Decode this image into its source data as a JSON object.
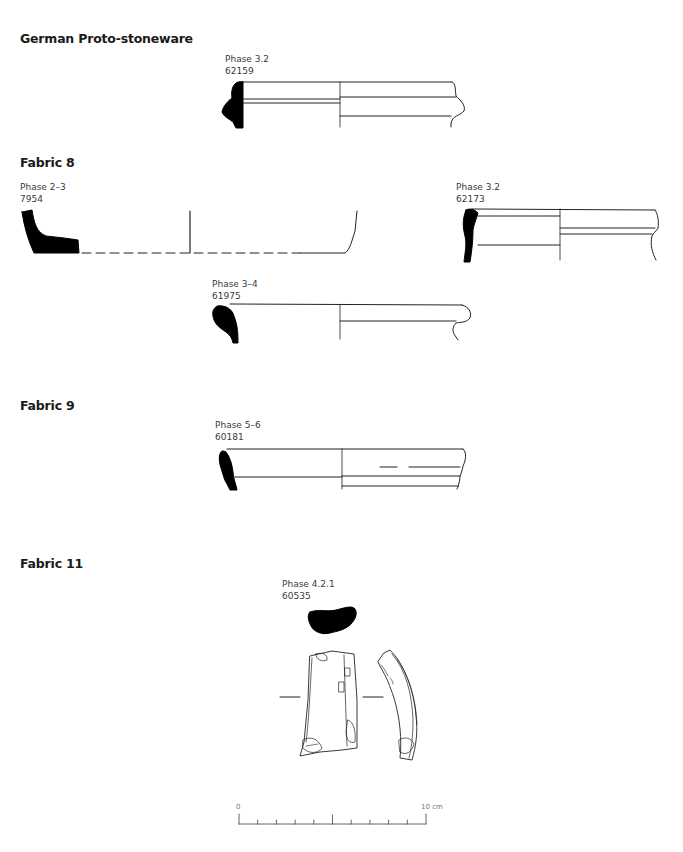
{
  "sections": [
    {
      "heading": "German Proto-stoneware",
      "items": [
        {
          "phase": "Phase 3.2",
          "number": "62159"
        }
      ]
    },
    {
      "heading": "Fabric 8",
      "items": [
        {
          "phase": "Phase 2–3",
          "number": "7954"
        },
        {
          "phase": "Phase 3.2",
          "number": "62173"
        },
        {
          "phase": "Phase 3–4",
          "number": "61975"
        }
      ]
    },
    {
      "heading": "Fabric 9",
      "items": [
        {
          "phase": "Phase 5–6",
          "number": "60181"
        }
      ]
    },
    {
      "heading": "Fabric 11",
      "items": [
        {
          "phase": "Phase 4.2.1",
          "number": "60535"
        }
      ]
    }
  ],
  "scale_bar": {
    "start_label": "0",
    "end_label": "10 cm",
    "divisions": 10
  },
  "colors": {
    "ink": "#000000",
    "line": "#222222",
    "text": "#3a3a3a",
    "heading": "#1a1a1a",
    "scale": "#777777"
  }
}
